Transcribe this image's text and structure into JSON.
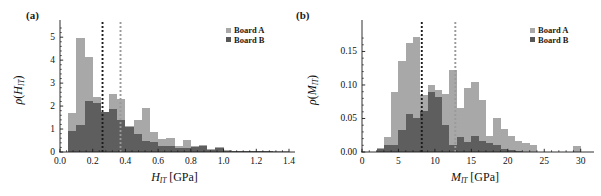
{
  "figure": {
    "width": 601,
    "height": 196,
    "background": "#ffffff"
  },
  "style": {
    "board_a_color": "#a8a8a8",
    "board_b_color": "#585858",
    "overlap_color": "#6f6f6f",
    "axis_color": "#1a1a1a",
    "line_a_color": "#9a9a9a",
    "line_b_color": "#1c1c1c"
  },
  "panels": [
    {
      "id": "a",
      "label": "(a)",
      "legend": {
        "items": [
          {
            "label": "Board A",
            "color": "#a8a8a8"
          },
          {
            "label": "Board B",
            "color": "#585858"
          }
        ]
      },
      "chart_data": {
        "type": "bar",
        "subtype": "histogram-overlaid",
        "title": "",
        "xlabel": "H_IT [GPa]",
        "xlabel_parts": {
          "symbol": "H",
          "subscript": "IT",
          "unit": "[GPa]"
        },
        "ylabel": "ρ(H_IT)",
        "ylabel_parts": {
          "rho": "ρ",
          "symbol": "H",
          "subscript": "IT"
        },
        "xlim": [
          0.0,
          1.4
        ],
        "ylim": [
          0,
          5.4
        ],
        "xticks": [
          0.0,
          0.2,
          0.4,
          0.6,
          0.8,
          1.0,
          1.2,
          1.4
        ],
        "xticklabels": [
          "0.0",
          "0.2",
          "0.4",
          "0.6",
          "0.8",
          "1.0",
          "1.2",
          "1.4"
        ],
        "yticks": [
          0,
          1,
          2,
          3,
          4,
          5
        ],
        "yticklabels": [
          "0",
          "1",
          "2",
          "3",
          "4",
          "5"
        ],
        "grid": false,
        "legend_position": "top-right",
        "bin_width": 0.05,
        "bin_starts": [
          0.05,
          0.1,
          0.15,
          0.2,
          0.25,
          0.3,
          0.35,
          0.4,
          0.45,
          0.5,
          0.55,
          0.6,
          0.65,
          0.7,
          0.75,
          0.8,
          0.85,
          0.9,
          0.95,
          1.0,
          1.05,
          1.1,
          1.15,
          1.2,
          1.25,
          1.3,
          1.35
        ],
        "series": [
          {
            "name": "Board A",
            "color": "#a8a8a8",
            "values": [
              1.7,
              4.97,
              4.13,
              2.4,
              1.74,
              2.53,
              2.32,
              1.14,
              1.38,
              1.93,
              0.87,
              0.57,
              0.63,
              0.27,
              0.54,
              0.26,
              0.3,
              0.15,
              0.2,
              0.07,
              0.06,
              0.06,
              0.05,
              0.05,
              0.06,
              0.05,
              0.05
            ]
          },
          {
            "name": "Board B",
            "color": "#585858",
            "values": [
              0.9,
              1.17,
              2.22,
              2.13,
              1.73,
              1.87,
              1.38,
              1.08,
              0.77,
              0.47,
              0.45,
              0.24,
              0.26,
              0.18,
              0.17,
              0.23,
              0.24,
              0.1,
              0.17,
              0.05,
              0.04,
              0.03,
              0.03,
              0.03,
              0.03,
              0.02,
              0.02
            ]
          }
        ],
        "vlines": [
          {
            "x": 0.26,
            "color": "#1c1c1c",
            "style": "dotted",
            "series": "Board B"
          },
          {
            "x": 0.37,
            "color": "#9a9a9a",
            "style": "dotted",
            "series": "Board A"
          }
        ]
      }
    },
    {
      "id": "b",
      "label": "(b)",
      "legend": {
        "items": [
          {
            "label": "Board A",
            "color": "#a8a8a8"
          },
          {
            "label": "Board B",
            "color": "#585858"
          }
        ]
      },
      "chart_data": {
        "type": "bar",
        "subtype": "histogram-overlaid",
        "title": "",
        "xlabel": "M_IT [GPa]",
        "xlabel_parts": {
          "symbol": "M",
          "subscript": "IT",
          "unit": "[GPa]"
        },
        "ylabel": "ρ(M_IT)",
        "ylabel_parts": {
          "rho": "ρ",
          "symbol": "M",
          "subscript": "IT"
        },
        "xlim": [
          0,
          31
        ],
        "ylim": [
          0.0,
          0.185
        ],
        "xticks": [
          0,
          5,
          10,
          15,
          20,
          25,
          30
        ],
        "xticklabels": [
          "0",
          "5",
          "10",
          "15",
          "20",
          "25",
          "30"
        ],
        "yticks": [
          0.0,
          0.05,
          0.1,
          0.15
        ],
        "yticklabels": [
          "0.00",
          "0.05",
          "0.10",
          "0.15"
        ],
        "grid": false,
        "legend_position": "top-right",
        "bin_width": 1.0,
        "bin_starts": [
          2,
          3,
          4,
          5,
          6,
          7,
          8,
          9,
          10,
          11,
          12,
          13,
          14,
          15,
          16,
          17,
          18,
          19,
          20,
          21,
          22,
          23,
          24,
          25,
          26,
          27,
          28,
          29
        ],
        "series": [
          {
            "name": "Board A",
            "color": "#a8a8a8",
            "values": [
              0.006,
              0.023,
              0.09,
              0.136,
              0.162,
              0.172,
              0.085,
              0.1,
              0.093,
              0.086,
              0.123,
              0.066,
              0.096,
              0.104,
              0.077,
              0.024,
              0.05,
              0.035,
              0.024,
              0.016,
              0.014,
              0.011,
              0.0,
              0.0,
              0.0,
              0.0,
              0.0,
              0.009
            ]
          },
          {
            "name": "Board B",
            "color": "#585858",
            "values": [
              0.004,
              0.01,
              0.01,
              0.033,
              0.056,
              0.05,
              0.061,
              0.089,
              0.082,
              0.04,
              0.01,
              0.022,
              0.015,
              0.024,
              0.016,
              0.014,
              0.01,
              0.004,
              0.003,
              0.002,
              0.0,
              0.0,
              0.0,
              0.0,
              0.0,
              0.0,
              0.0,
              0.0
            ]
          }
        ],
        "vlines": [
          {
            "x": 8.2,
            "color": "#1c1c1c",
            "style": "dotted",
            "series": "Board B"
          },
          {
            "x": 12.8,
            "color": "#9a9a9a",
            "style": "dotted",
            "series": "Board A"
          }
        ]
      }
    }
  ]
}
